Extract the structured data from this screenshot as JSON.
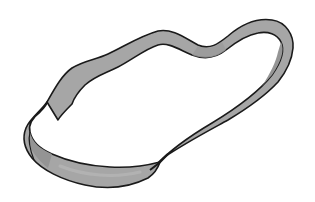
{
  "image": {
    "subject": "Twisted band (Möbius-strip-like loop) line drawing",
    "width": 315,
    "height": 202,
    "background_color": "#ffffff",
    "band_fill_color": "#a6a6a6",
    "band_shade_color": "#8f8f8f",
    "band_highlight_color": "#b8b8b8",
    "outline_color": "#1a1a1a"
  }
}
